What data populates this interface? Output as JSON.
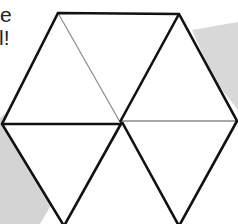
{
  "caption": {
    "line1": "e",
    "line2": "l!"
  },
  "diagram": {
    "shape": "hexagon",
    "subdivision": "6 triangles meeting at center",
    "vertices": {
      "top_left": [
        58,
        13
      ],
      "top_right": [
        179,
        14
      ],
      "right": [
        237,
        121
      ],
      "bottom_right": [
        179,
        226
      ],
      "bottom_left": [
        64,
        226
      ],
      "left": [
        2,
        124
      ],
      "center": [
        120,
        122
      ]
    },
    "thick_spokes": [
      "top_right",
      "left",
      "bottom_left",
      "bottom_right"
    ],
    "thin_spokes": [
      "top_left",
      "right"
    ]
  },
  "colors": {
    "background": "#ffffff",
    "stroke_thick": "#111111",
    "stroke_thin": "#8a8a8a",
    "gray_shape": "#d6d6d6",
    "text": "#222222"
  }
}
